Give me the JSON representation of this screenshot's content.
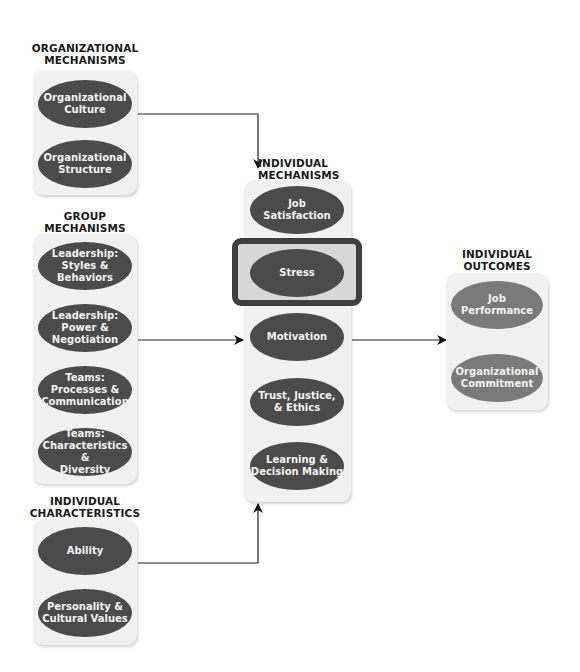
{
  "groups": {
    "organizational": {
      "title": "ORGANIZATIONAL\nMECHANISMS",
      "items": [
        "Organizational\nCulture",
        "Organizational\nStructure"
      ]
    },
    "group": {
      "title": "GROUP\nMECHANISMS",
      "items": [
        "Leadership:\nStyles &\nBehaviors",
        "Leadership:\nPower &\nNegotiation",
        "Teams:\nProcesses &\nCommunication",
        "Teams:\nCharacteristics &\nDiversity"
      ]
    },
    "individual_characteristics": {
      "title": "INDIVIDUAL\nCHARACTERISTICS",
      "items": [
        "Ability",
        "Personality &\nCultural Values"
      ]
    },
    "individual_mechanisms": {
      "title": "INDIVIDUAL\nMECHANISMS",
      "items": [
        "Job\nSatisfaction",
        "Stress",
        "Motivation",
        "Trust, Justice,\n& Ethics",
        "Learning &\nDecision Making"
      ],
      "highlighted": "Stress"
    },
    "individual_outcomes": {
      "title": "INDIVIDUAL\nOUTCOMES",
      "items": [
        "Job\nPerformance",
        "Organizational\nCommitment"
      ]
    }
  },
  "colors": {
    "ellipse_dark": "#4b4b4b",
    "ellipse_light": "#7a7a7a",
    "panel": "#f1f1f1",
    "highlight_border": "#3f3f3f"
  }
}
